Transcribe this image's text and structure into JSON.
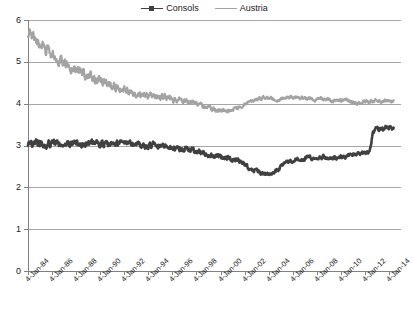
{
  "chart_data": {
    "type": "line",
    "title": "",
    "subtitle": "",
    "xlabel": "",
    "ylabel": "",
    "grid": true,
    "legend_position": "top-center",
    "ylim": [
      0,
      6
    ],
    "yticks": [
      "0",
      "1",
      "2",
      "3",
      "4",
      "5",
      "6"
    ],
    "xlim": [
      "4-Jan-84",
      "4-Jan-14"
    ],
    "xticks": [
      "4-Jan-84",
      "4-Jan-86",
      "4-Jan-88",
      "4-Jan-90",
      "4-Jan-92",
      "4-Jan-94",
      "4-Jan-96",
      "4-Jan-98",
      "4-Jan-00",
      "4-Jan-02",
      "4-Jan-04",
      "4-Jan-06",
      "4-Jan-08",
      "4-Jan-10",
      "4-Jan-12",
      "4-Jan-14"
    ],
    "colors": {
      "consols": "#404040",
      "austria": "#a3a3a3",
      "grid": "#a6a6a6",
      "axis": "#808080",
      "text": "#1a1a1a",
      "background": "#ffffff"
    },
    "series": [
      {
        "name": "Consols",
        "color": "#404040",
        "marker": "square",
        "x": [
          1984.0,
          1984.5,
          1985.0,
          1985.5,
          1986.0,
          1986.5,
          1987.0,
          1987.5,
          1988.0,
          1988.5,
          1989.0,
          1989.5,
          1990.0,
          1990.5,
          1991.0,
          1991.5,
          1992.0,
          1992.5,
          1993.0,
          1993.5,
          1994.0,
          1994.5,
          1995.0,
          1995.5,
          1996.0,
          1996.5,
          1997.0,
          1997.5,
          1998.0,
          1998.5,
          1999.0,
          1999.5,
          2000.0,
          2000.5,
          2001.0,
          2001.5,
          2002.0,
          2002.5,
          2003.0,
          2003.5,
          2004.0,
          2004.5,
          2005.0,
          2005.5,
          2006.0,
          2006.5,
          2007.0,
          2007.5,
          2008.0,
          2008.5,
          2009.0,
          2009.5,
          2010.0,
          2010.5,
          2011.0,
          2011.5,
          2012.0,
          2012.3,
          2012.6,
          2013.0,
          2013.5,
          2014.0
        ],
        "values": [
          3.02,
          3.05,
          3.03,
          3.0,
          3.04,
          3.06,
          3.02,
          3.05,
          3.07,
          3.03,
          3.05,
          3.08,
          3.04,
          3.02,
          3.05,
          3.03,
          3.06,
          3.02,
          3.0,
          2.98,
          3.0,
          3.02,
          2.99,
          2.97,
          2.95,
          2.93,
          2.92,
          2.88,
          2.85,
          2.8,
          2.76,
          2.74,
          2.72,
          2.7,
          2.66,
          2.6,
          2.5,
          2.42,
          2.36,
          2.33,
          2.34,
          2.42,
          2.55,
          2.62,
          2.68,
          2.66,
          2.72,
          2.7,
          2.74,
          2.72,
          2.7,
          2.72,
          2.74,
          2.76,
          2.8,
          2.82,
          2.84,
          3.3,
          3.42,
          3.38,
          3.44,
          3.4
        ]
      },
      {
        "name": "Austria",
        "color": "#a3a3a3",
        "marker": "line",
        "x": [
          1984.0,
          1984.5,
          1985.0,
          1985.5,
          1986.0,
          1986.5,
          1987.0,
          1987.5,
          1988.0,
          1988.5,
          1989.0,
          1989.5,
          1990.0,
          1990.5,
          1991.0,
          1991.5,
          1992.0,
          1992.5,
          1993.0,
          1993.5,
          1994.0,
          1994.5,
          1995.0,
          1995.5,
          1996.0,
          1996.5,
          1997.0,
          1997.5,
          1998.0,
          1998.5,
          1999.0,
          1999.5,
          2000.0,
          2000.5,
          2001.0,
          2001.5,
          2002.0,
          2002.5,
          2003.0,
          2003.5,
          2004.0,
          2004.5,
          2005.0,
          2005.5,
          2006.0,
          2006.5,
          2007.0,
          2007.5,
          2008.0,
          2008.5,
          2009.0,
          2009.5,
          2010.0,
          2010.5,
          2011.0,
          2011.5,
          2012.0,
          2012.5,
          2013.0,
          2013.5,
          2014.0
        ],
        "values": [
          5.7,
          5.55,
          5.4,
          5.3,
          5.18,
          5.05,
          4.98,
          4.88,
          4.8,
          4.72,
          4.66,
          4.58,
          4.54,
          4.48,
          4.44,
          4.38,
          4.34,
          4.28,
          4.24,
          4.2,
          4.18,
          4.16,
          4.14,
          4.12,
          4.1,
          4.08,
          4.06,
          4.02,
          3.98,
          3.92,
          3.88,
          3.84,
          3.82,
          3.84,
          3.88,
          3.94,
          4.02,
          4.08,
          4.12,
          4.14,
          4.12,
          4.1,
          4.12,
          4.14,
          4.16,
          4.14,
          4.12,
          4.1,
          4.12,
          4.1,
          4.08,
          4.06,
          4.08,
          4.04,
          4.02,
          4.04,
          4.06,
          4.08,
          4.06,
          4.08,
          4.06
        ]
      }
    ]
  },
  "legend": {
    "entries": [
      {
        "label": "Consols",
        "color": "#404040",
        "marker": "square"
      },
      {
        "label": "Austria",
        "color": "#a3a3a3",
        "marker": "line"
      }
    ]
  }
}
